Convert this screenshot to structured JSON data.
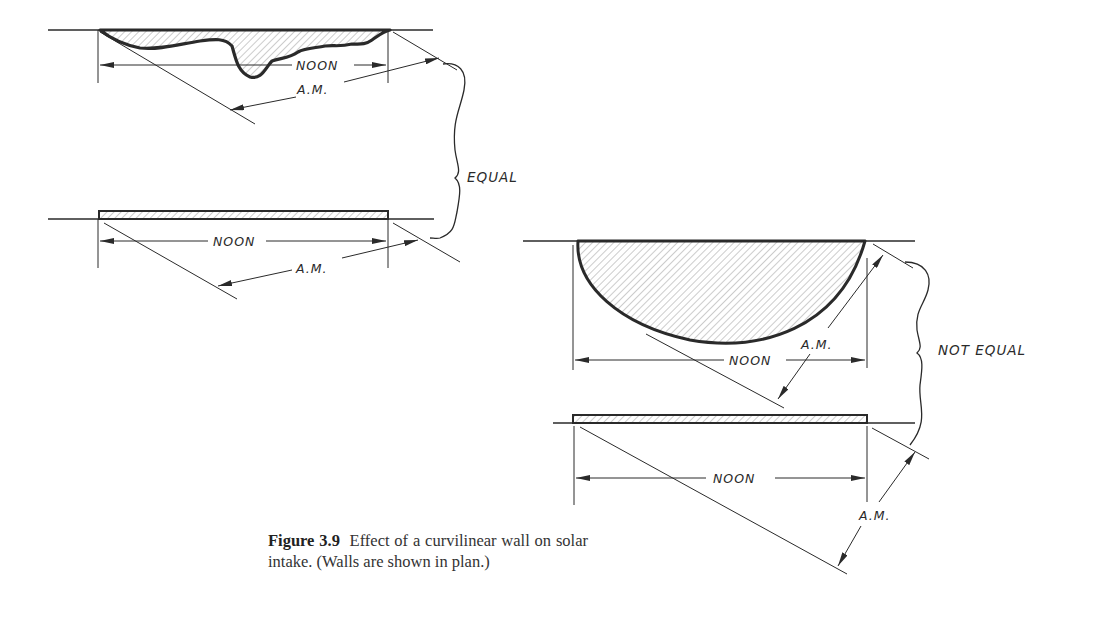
{
  "figure": {
    "number_label": "Figure 3.9",
    "caption_text": "Effect of a curvilinear wall on solar intake. (Walls are shown in plan.)"
  },
  "diagram": {
    "left_group": {
      "top_wall": {
        "type": "irregular-curvilinear",
        "noon_label": "NOON",
        "am_label": "A.M."
      },
      "bottom_wall": {
        "type": "flat",
        "noon_label": "NOON",
        "am_label": "A.M."
      },
      "comparison_label": "EQUAL"
    },
    "right_group": {
      "top_wall": {
        "type": "semicircular-curvilinear",
        "noon_label": "NOON",
        "am_label": "A.M."
      },
      "bottom_wall": {
        "type": "flat",
        "noon_label": "NOON",
        "am_label": "A.M."
      },
      "comparison_label": "NOT EQUAL"
    }
  },
  "colors": {
    "ink": "#2a2a2a",
    "hatch": "#8a8a8a",
    "background": "#ffffff"
  }
}
